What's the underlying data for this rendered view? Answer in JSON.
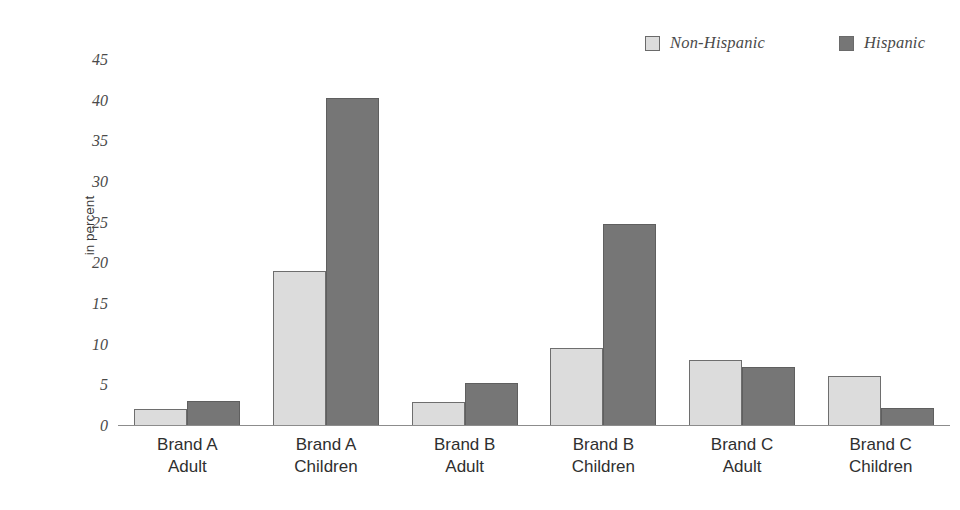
{
  "chart_data": {
    "type": "bar",
    "title": "",
    "xlabel": "",
    "ylabel": "in percent",
    "ylim": [
      0,
      45
    ],
    "yticks": [
      0,
      5,
      10,
      15,
      20,
      25,
      30,
      35,
      40,
      45
    ],
    "grid": false,
    "legend_position": "top-right",
    "categories": [
      "Brand A Adult",
      "Brand A Children",
      "Brand B Adult",
      "Brand B Children",
      "Brand C Adult",
      "Brand C Children"
    ],
    "category_lines": [
      [
        "Brand A",
        "Adult"
      ],
      [
        "Brand A",
        "Children"
      ],
      [
        "Brand B",
        "Adult"
      ],
      [
        "Brand B",
        "Children"
      ],
      [
        "Brand C",
        "Adult"
      ],
      [
        "Brand C",
        "Children"
      ]
    ],
    "series": [
      {
        "name": "Non-Hispanic",
        "color": "#dcdcdc",
        "values": [
          2.1,
          19.0,
          2.9,
          9.6,
          8.1,
          6.1
        ]
      },
      {
        "name": "Hispanic",
        "color": "#767676",
        "values": [
          3.1,
          40.3,
          5.3,
          24.8,
          7.2,
          2.2
        ]
      }
    ]
  },
  "legend": {
    "items": [
      {
        "label": "Non-Hispanic",
        "swatch": "light-gray-swatch-icon"
      },
      {
        "label": "Hispanic",
        "swatch": "dark-gray-swatch-icon"
      }
    ]
  },
  "axes": {
    "y_title": "in percent",
    "y_tick_labels": [
      "45",
      "40",
      "35",
      "30",
      "25",
      "20",
      "15",
      "10",
      "5",
      "0"
    ]
  }
}
